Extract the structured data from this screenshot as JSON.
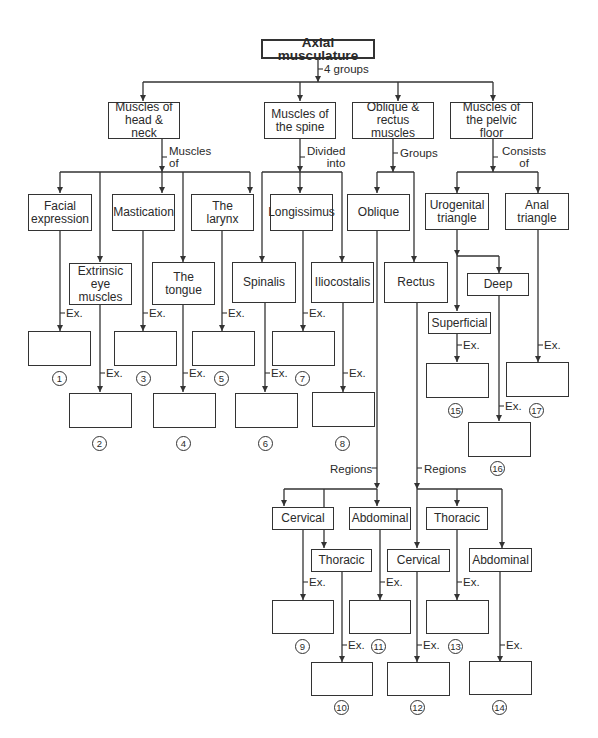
{
  "diagram": {
    "root": "Axial musculature",
    "root_connector": "4 groups",
    "groups": [
      {
        "label": "Muscles of\nhead & neck",
        "connector": "Muscles\nof",
        "children": [
          "Facial\nexpression",
          "Extrinsic\neye\nmuscles",
          "Mastication",
          "The\ntongue",
          "The\nlarynx"
        ],
        "answers": [
          "1",
          "2",
          "3",
          "4",
          "5"
        ]
      },
      {
        "label": "Muscles of\nthe spine",
        "connector": "Divided\ninto",
        "children": [
          "Spinalis",
          "Longissimus",
          "Iliocostalis"
        ],
        "answers": [
          "6",
          "7",
          "8"
        ]
      },
      {
        "label": "Oblique &\nrectus muscles",
        "connector": "Groups",
        "children": [
          "Oblique",
          "Rectus"
        ],
        "regions_label": "Regions",
        "oblique_regions": [
          "Cervical",
          "Thoracic",
          "Abdominal"
        ],
        "oblique_answers": [
          "9",
          "10",
          "11"
        ],
        "rectus_regions": [
          "Cervical",
          "Thoracic",
          "Abdominal"
        ],
        "rectus_answers": [
          "12",
          "13",
          "14"
        ]
      },
      {
        "label": "Muscles of\nthe pelvic floor",
        "connector": "Consists\nof",
        "children": [
          "Urogenital\ntriangle",
          "Anal\ntriangle"
        ],
        "urogenital_children": [
          "Superficial",
          "Deep"
        ],
        "answers": [
          "15",
          "16",
          "17"
        ]
      }
    ],
    "example_label": "Ex."
  }
}
